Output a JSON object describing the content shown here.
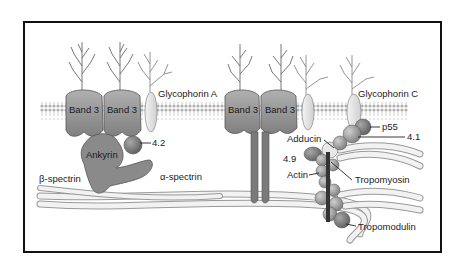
{
  "diagram": {
    "frame": {
      "border_color": "#111111",
      "background": "#ffffff"
    },
    "colors": {
      "protein_dark": "#7a7a7a",
      "protein_mid": "#9a9a9a",
      "protein_light": "#e6e6e6",
      "bilayer": "#c8c8c8",
      "spectrin": "#efefef",
      "text": "#222222"
    },
    "labels": {
      "band3_1": "Band 3",
      "band3_2": "Band 3",
      "band3_3": "Band 3",
      "band3_4": "Band 3",
      "glycophorin_a": "Glycophorin A",
      "glycophorin_c": "Glycophorin C",
      "ankyrin": "Ankyrin",
      "protein_4_2": "4.2",
      "beta_spectrin": "β-spectrin",
      "alpha_spectrin": "α-spectrin",
      "adducin": "Adducin",
      "p55": "p55",
      "protein_4_1": "4.1",
      "protein_4_9": "4.9",
      "actin": "Actin",
      "tropomyosin": "Tropomyosin",
      "tropomodulin": "Tropomodulin"
    }
  }
}
